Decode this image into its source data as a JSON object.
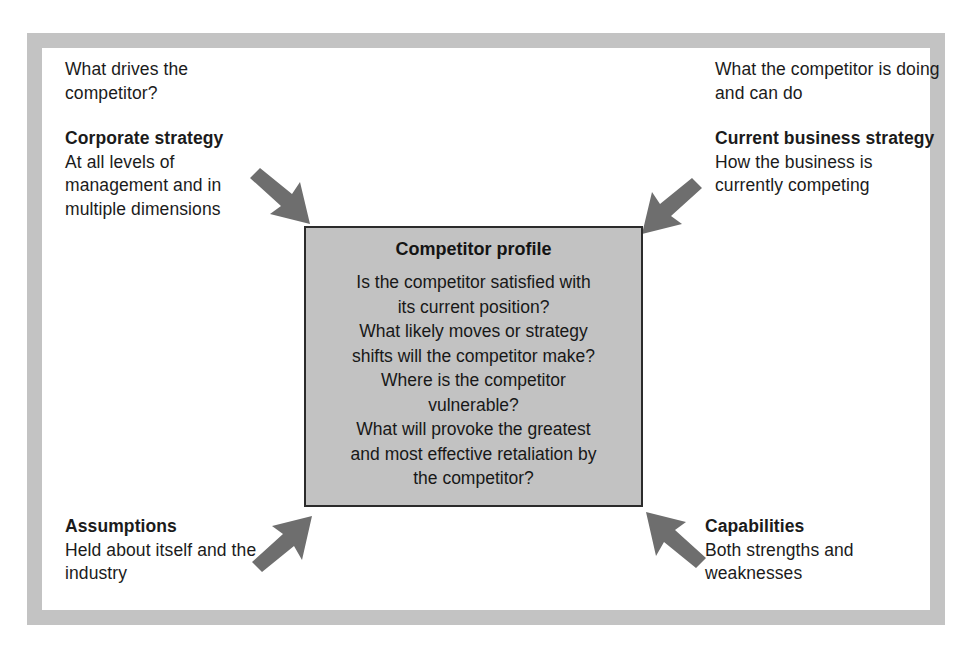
{
  "figure": {
    "center_box": {
      "title": "Competitor profile",
      "questions": [
        "Is the competitor satisfied with",
        "its current position?",
        "What likely moves or strategy",
        "shifts will the competitor make?",
        "Where is the competitor",
        "vulnerable?",
        "What will provoke the greatest",
        "and most effective retaliation by",
        "the competitor?"
      ]
    },
    "quadrants": {
      "top_left": {
        "lead": "What drives the competitor?",
        "heading": "Corporate strategy",
        "detail": "At all levels of management and in multiple dimensions"
      },
      "top_right": {
        "lead": "What the competitor is doing and can do",
        "heading": "Current business strategy",
        "detail": "How the business is currently competing"
      },
      "bottom_left": {
        "lead": "",
        "heading": "Assumptions",
        "detail": "Held about itself and the industry"
      },
      "bottom_right": {
        "lead": "",
        "heading": "Capabilities",
        "detail": "Both strengths and weaknesses"
      }
    },
    "colors": {
      "frame": "#c3c3c3",
      "box_fill": "#c2c2c2",
      "box_border": "#2b2b2b",
      "arrow": "#6e6e6e",
      "text": "#1b1b1b"
    }
  }
}
